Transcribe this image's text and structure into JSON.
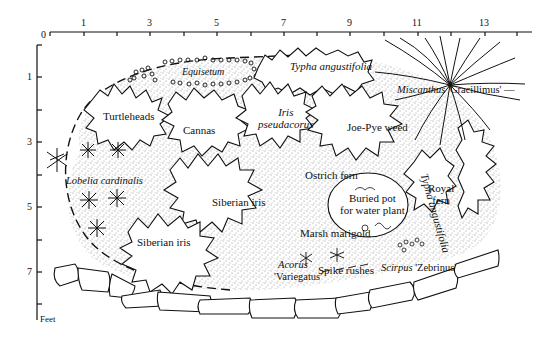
{
  "diagram": {
    "units_label": "Feet",
    "x_axis": {
      "origin_label": "0",
      "tick_labels": [
        "1",
        "3",
        "5",
        "7",
        "9",
        "11",
        "13"
      ]
    },
    "y_axis": {
      "tick_labels": [
        "1",
        "3",
        "5",
        "7"
      ]
    },
    "plants": [
      {
        "id": "equisetum",
        "label": "Equisetum",
        "italic": true
      },
      {
        "id": "typha-top",
        "label": "Typha angustifolia",
        "italic": true
      },
      {
        "id": "miscanthus",
        "label_italic": "Miscanthus",
        "label_roman": " 'Gracillimus'"
      },
      {
        "id": "turtleheads",
        "label": "Turtleheads",
        "italic": false
      },
      {
        "id": "cannas",
        "label": "Cannas",
        "italic": false
      },
      {
        "id": "iris-pseudacorus",
        "line1": "Iris",
        "line2": "pseudacorus",
        "italic": true
      },
      {
        "id": "joe-pye-weed",
        "label": "Joe-Pye weed",
        "italic": false
      },
      {
        "id": "typha-right",
        "label": "Typha angustifolia",
        "italic": true
      },
      {
        "id": "lobelia",
        "label": "Lobelia cardinalis",
        "italic": true
      },
      {
        "id": "ostrich-fern",
        "label": "Ostrich fern",
        "italic": false
      },
      {
        "id": "royal-fern",
        "line1": "Royal",
        "line2": "fern",
        "italic": false
      },
      {
        "id": "buried-pot",
        "line1": "Buried pot",
        "line2": "for water plant",
        "italic": false
      },
      {
        "id": "siberian-iris-1",
        "label": "Siberian iris",
        "italic": false
      },
      {
        "id": "siberian-iris-2",
        "label": "Siberian iris",
        "italic": false
      },
      {
        "id": "marsh-marigold",
        "label": "Marsh marigold",
        "italic": false
      },
      {
        "id": "acorus",
        "line1": "Acorus",
        "line2": "'Variegatus'"
      },
      {
        "id": "spike-rushes",
        "label": "Spike rushes",
        "italic": false
      },
      {
        "id": "scirpus",
        "label_italic": "Scirpus",
        "label_roman": " 'Zebrinus'"
      }
    ]
  }
}
